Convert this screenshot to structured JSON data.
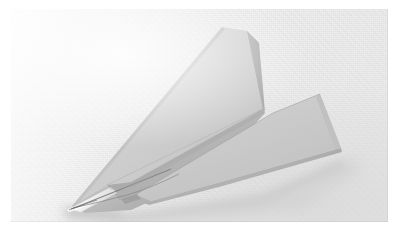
{
  "image": {
    "subject": "paper airplane",
    "scene_description": "A folded white paper dart airplane resting on a light gray textured paper surface, lit from the upper left, casting a soft shadow to the lower left.",
    "orientation": "nose pointing to the lower left",
    "photo": {
      "x": 11,
      "y": 9,
      "width": 377,
      "height": 213
    },
    "canvas": {
      "width": 401,
      "height": 234
    }
  },
  "colors": {
    "page_background": "#ffffff",
    "photo_background": "#f0f0f0",
    "paper_top_face": "#d2d2d2",
    "paper_upper_wing_light": "#cfcfcf",
    "paper_upper_wing_shadow": "#b4b4b4",
    "paper_body_face": "#b0b0b0",
    "paper_lower_wing": "#c9c9c9",
    "paper_lower_wing_edge": "#a8a8a8",
    "fold_line": "#6f6f6f",
    "nose_highlight": "#fbfbfb",
    "cast_shadow": "#c6c6c6"
  },
  "geometry": {
    "nose_tip": [
      61,
      197
    ],
    "upper_wing_apex": [
      211,
      18
    ],
    "upper_wing_right": [
      253,
      102
    ],
    "right_wing_tip": [
      309,
      85
    ],
    "right_wing_rear": [
      330,
      139
    ],
    "tail_bottom": [
      120,
      201
    ]
  },
  "labels": {
    "caption": ""
  }
}
